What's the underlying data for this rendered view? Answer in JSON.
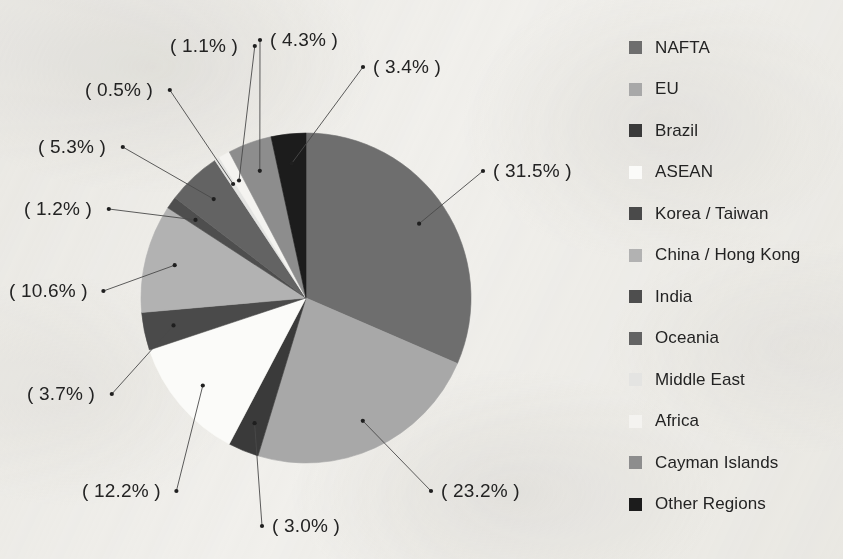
{
  "figure": {
    "background_color": "#f2f1ee",
    "text_color": "#232323"
  },
  "chart_data": {
    "type": "pie",
    "title": "",
    "subtitle": "",
    "xlabel": "",
    "ylabel": "",
    "grid": false,
    "legend_position": "right",
    "label_format": "( {value}% )",
    "start_angle_deg": 0,
    "direction": "clockwise",
    "center_px": [
      306,
      298
    ],
    "radius_px": 165,
    "categories": [
      "NAFTA",
      "EU",
      "Brazil",
      "ASEAN",
      "Korea / Taiwan",
      "China / Hong Kong",
      "India",
      "Oceania",
      "Middle East",
      "Africa",
      "Cayman Islands",
      "Other Regions"
    ],
    "values": [
      31.5,
      23.2,
      3.0,
      12.2,
      3.7,
      10.6,
      1.2,
      5.3,
      0.5,
      1.1,
      4.3,
      3.4
    ],
    "colors": [
      "#6e6e6e",
      "#a8a8a8",
      "#3a3a3a",
      "#fbfbf9",
      "#4a4a4a",
      "#b2b2b2",
      "#4e4e4e",
      "#636363",
      "#e4e4e2",
      "#f4f3f0",
      "#8d8d8d",
      "#1c1c1c"
    ],
    "labels": [
      "( 31.5% )",
      "( 23.2% )",
      "( 3.0% )",
      "( 12.2% )",
      "( 3.7% )",
      "( 10.6% )",
      "( 1.2% )",
      "( 5.3% )",
      "( 0.5% )",
      "( 1.1% )",
      "( 4.3% )",
      "( 3.4% )"
    ]
  },
  "legend": {
    "items": [
      {
        "label": "NAFTA",
        "color": "#6e6e6e"
      },
      {
        "label": "EU",
        "color": "#a8a8a8"
      },
      {
        "label": "Brazil",
        "color": "#3a3a3a"
      },
      {
        "label": "ASEAN",
        "color": "#fbfbf9"
      },
      {
        "label": "Korea / Taiwan",
        "color": "#4a4a4a"
      },
      {
        "label": "China / Hong Kong",
        "color": "#b2b2b2"
      },
      {
        "label": "India",
        "color": "#4e4e4e"
      },
      {
        "label": "Oceania",
        "color": "#636363"
      },
      {
        "label": "Middle East",
        "color": "#e4e4e2"
      },
      {
        "label": "Africa",
        "color": "#f4f3f0"
      },
      {
        "label": "Cayman Islands",
        "color": "#8d8d8d"
      },
      {
        "label": "Other Regions",
        "color": "#1c1c1c"
      }
    ]
  },
  "callouts": [
    {
      "label": "( 31.5% )",
      "x": 493,
      "y": 160,
      "anchor": "left"
    },
    {
      "label": "( 23.2% )",
      "x": 441,
      "y": 480,
      "anchor": "left"
    },
    {
      "label": "( 3.0% )",
      "x": 272,
      "y": 515,
      "anchor": "left"
    },
    {
      "label": "( 12.2% )",
      "x": 82,
      "y": 480,
      "anchor": "left"
    },
    {
      "label": "( 3.7% )",
      "x": 27,
      "y": 383,
      "anchor": "left"
    },
    {
      "label": "( 10.6% )",
      "x": 9,
      "y": 280,
      "anchor": "left"
    },
    {
      "label": "( 1.2% )",
      "x": 24,
      "y": 198,
      "anchor": "left"
    },
    {
      "label": "( 5.3% )",
      "x": 38,
      "y": 136,
      "anchor": "left"
    },
    {
      "label": "( 0.5% )",
      "x": 85,
      "y": 79,
      "anchor": "left"
    },
    {
      "label": "( 1.1% )",
      "x": 170,
      "y": 35,
      "anchor": "left"
    },
    {
      "label": "( 4.3% )",
      "x": 270,
      "y": 29,
      "anchor": "left"
    },
    {
      "label": "( 3.4% )",
      "x": 373,
      "y": 56,
      "anchor": "left"
    }
  ]
}
